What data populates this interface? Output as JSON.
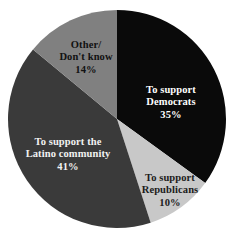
{
  "chart_data": {
    "type": "pie",
    "title": "",
    "subtitle": "",
    "xlabel": "",
    "ylabel": "",
    "units": "percent",
    "start_angle_deg": 0,
    "direction": "clockwise",
    "legend": "none",
    "grid": false,
    "background_color": "#ffffff",
    "categories": [
      "To support Democrats",
      "To support Republicans",
      "To support the Latino community",
      "Other/ Don't know"
    ],
    "values": [
      35,
      10,
      41,
      14
    ],
    "colors": [
      "#0a0a0a",
      "#c8c8c8",
      "#3a3a3a",
      "#808080"
    ],
    "slices": [
      {
        "id": "democrats",
        "label_lines": [
          "To support",
          "Democrats"
        ],
        "value": 35,
        "value_text": "35%",
        "color": "#0a0a0a",
        "text_color": "#ffffff",
        "start_deg": 0,
        "end_deg": 126
      },
      {
        "id": "republicans",
        "label_lines": [
          "To support",
          "Republicans"
        ],
        "value": 10,
        "value_text": "10%",
        "color": "#c8c8c8",
        "text_color": "#1b1b1b",
        "start_deg": 126,
        "end_deg": 162
      },
      {
        "id": "latino",
        "label_lines": [
          "To support the",
          "Latino community"
        ],
        "value": 41,
        "value_text": "41%",
        "color": "#3a3a3a",
        "text_color": "#f2f2f2",
        "start_deg": 162,
        "end_deg": 309.6
      },
      {
        "id": "other",
        "label_lines": [
          "Other/",
          "Don't know"
        ],
        "value": 14,
        "value_text": "14%",
        "color": "#808080",
        "text_color": "#111111",
        "start_deg": 309.6,
        "end_deg": 360
      }
    ],
    "geometry": {
      "center_x": 117,
      "center_y": 119,
      "radius": 109
    }
  }
}
